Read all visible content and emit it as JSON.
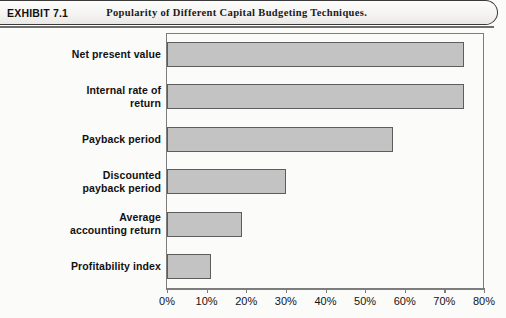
{
  "header": {
    "exhibit_label": "EXHIBIT 7.1",
    "title": "Popularity of Different Capital Budgeting Techniques."
  },
  "chart_data": {
    "type": "bar",
    "orientation": "horizontal",
    "title": "Popularity of Different Capital Budgeting Techniques.",
    "xlabel": "",
    "ylabel": "",
    "xlim": [
      0,
      80
    ],
    "grid": false,
    "legend": null,
    "bar_color": "#c3c3c3",
    "bar_border_color": "#5d5d5d",
    "axis_color": "#7d7d7d",
    "tick_labels": [
      "0%",
      "10%",
      "20%",
      "30%",
      "40%",
      "50%",
      "60%",
      "70%",
      "80%"
    ],
    "tick_values": [
      0,
      10,
      20,
      30,
      40,
      50,
      60,
      70,
      80
    ],
    "categories": [
      "Net present value",
      "Internal rate of return",
      "Payback period",
      "Discounted payback period",
      "Average accounting return",
      "Profitability index"
    ],
    "category_lines": [
      [
        "Net present value"
      ],
      [
        "Internal rate of",
        "return"
      ],
      [
        "Payback period"
      ],
      [
        "Discounted",
        "payback period"
      ],
      [
        "Average",
        "accounting return"
      ],
      [
        "Profitability index"
      ]
    ],
    "values": [
      75,
      75,
      57,
      30,
      19,
      11
    ]
  }
}
